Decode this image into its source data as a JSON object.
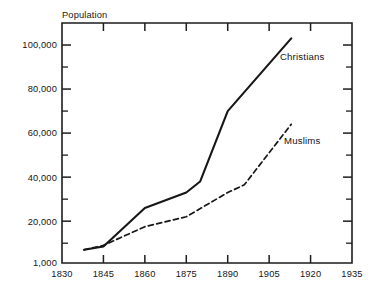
{
  "chart_data": {
    "type": "line",
    "title": "",
    "subtitle": "",
    "xlabel": "",
    "ylabel": "Population",
    "xlim": [
      1830,
      1935
    ],
    "ylim": [
      1000,
      110000
    ],
    "grid": false,
    "legend_position": "inline-right",
    "x_ticks": [
      1830,
      1845,
      1860,
      1875,
      1890,
      1905,
      1920,
      1935
    ],
    "x_tick_labels": [
      "1830",
      "1845",
      "1860",
      "1875",
      "1890",
      "1905",
      "1920",
      "1935"
    ],
    "y_ticks": [
      1000,
      20000,
      40000,
      60000,
      80000,
      100000
    ],
    "y_tick_labels": [
      "1,000",
      "20,000",
      "40,000",
      "60,000",
      "80,000",
      "100,000"
    ],
    "y_minor_ticks": [
      10000,
      30000,
      50000,
      70000,
      90000
    ],
    "series": [
      {
        "name": "Christians",
        "style": "solid",
        "color": "#171717",
        "label_x": 1917,
        "label_y": 93000,
        "x": [
          1838,
          1845,
          1860,
          1875,
          1880,
          1890,
          1913
        ],
        "values": [
          7000,
          8500,
          26000,
          33000,
          38000,
          70000,
          103000
        ]
      },
      {
        "name": "Muslims",
        "style": "dashed",
        "color": "#171717",
        "label_x": 1917,
        "label_y": 55000,
        "x": [
          1838,
          1845,
          1860,
          1875,
          1890,
          1896,
          1913
        ],
        "values": [
          7000,
          9000,
          17500,
          22000,
          33000,
          36500,
          64000
        ]
      }
    ]
  },
  "figure": {
    "axis_title": "Population"
  }
}
